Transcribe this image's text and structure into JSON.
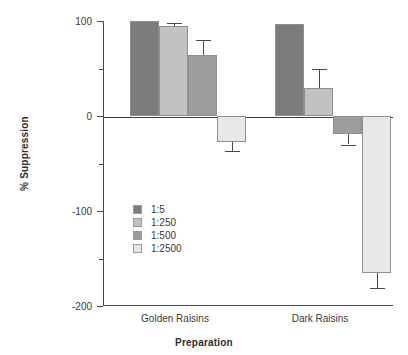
{
  "chart_data": {
    "type": "bar",
    "title": "",
    "xlabel": "Preparation",
    "ylabel": "% Suppression",
    "categories": [
      "Golden Raisins",
      "Dark Raisins"
    ],
    "ylim": [
      -200,
      100
    ],
    "yticks": [
      100,
      0,
      -100,
      -200
    ],
    "ytick_labels": [
      "100",
      "0",
      "-100",
      "-200"
    ],
    "yticks_minor": [
      50,
      -50,
      -150
    ],
    "grid": false,
    "legend_position": "inside-left",
    "series": [
      {
        "name": "1:5",
        "color": "#7c7c7c",
        "values": [
          100,
          97
        ],
        "errors": [
          0,
          0
        ]
      },
      {
        "name": "1:250",
        "color": "#c2c2c2",
        "values": [
          95,
          29
        ],
        "errors": [
          3,
          21
        ]
      },
      {
        "name": "1:500",
        "color": "#9d9d9d",
        "values": [
          64,
          -19
        ],
        "errors": [
          16,
          11
        ]
      },
      {
        "name": "1:2500",
        "color": "#e8e8e8",
        "values": [
          -27,
          -165
        ],
        "errors": [
          10,
          16
        ]
      }
    ]
  },
  "axes": {
    "ylabel": "% Suppression",
    "xlabel": "Preparation",
    "tick_100": "100",
    "tick_0": "0",
    "tick_minus100": "-100",
    "tick_minus200": "-200",
    "group_golden": "Golden Raisins",
    "group_dark": "Dark Raisins"
  },
  "legend": {
    "items": [
      {
        "label": "1:5",
        "color": "#7c7c7c"
      },
      {
        "label": "1:250",
        "color": "#c2c2c2"
      },
      {
        "label": "1:500",
        "color": "#9d9d9d"
      },
      {
        "label": "1:2500",
        "color": "#e8e8e8"
      }
    ]
  }
}
